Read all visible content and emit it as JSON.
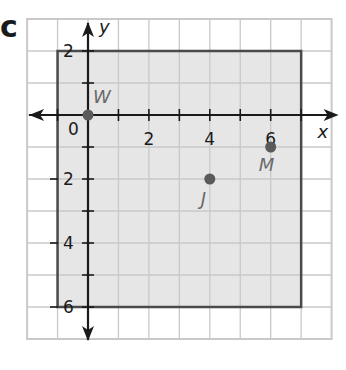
{
  "problem": {
    "part_label": "c"
  },
  "plane": {
    "x_range": [
      -2,
      8
    ],
    "y_range": [
      -7,
      3
    ],
    "axis_labels": {
      "x": "x",
      "y": "y"
    },
    "x_tick_labels": [
      {
        "value": 0,
        "text": "0"
      },
      {
        "value": 2,
        "text": "2"
      },
      {
        "value": 4,
        "text": "4"
      },
      {
        "value": 6,
        "text": "6"
      }
    ],
    "y_tick_labels": [
      {
        "value": 2,
        "text": "2"
      },
      {
        "value": -2,
        "text": "-2"
      },
      {
        "value": -4,
        "text": "-4"
      },
      {
        "value": -6,
        "text": "-6"
      }
    ],
    "colors": {
      "grid": "#c9c9c9",
      "region_fill": "#e6e6e6",
      "region_border": "#4a4a4a",
      "axis": "#1a1a1a",
      "point": "#5a5a5a",
      "point_label": "#6a6a6a"
    }
  },
  "region": {
    "description": "shaded rectangle",
    "x_min": -1,
    "x_max": 7,
    "y_min": -6,
    "y_max": 2
  },
  "points": [
    {
      "name": "W",
      "x": 0,
      "y": 0
    },
    {
      "name": "M",
      "x": 6,
      "y": -1
    },
    {
      "name": "J",
      "x": 4,
      "y": -2
    }
  ]
}
